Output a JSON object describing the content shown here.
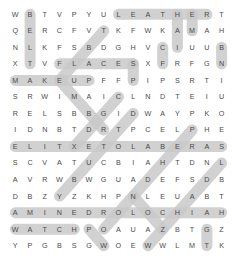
{
  "puzzle": {
    "type": "word-search",
    "rows": 15,
    "cols": 15,
    "highlight_color": "#c9c9c9",
    "letter_color": "#4a4a4a",
    "background_color": "#ffffff",
    "grid": [
      [
        "W",
        "B",
        "T",
        "V",
        "P",
        "Y",
        "U",
        "L",
        "E",
        "A",
        "T",
        "H",
        "E",
        "R",
        "T"
      ],
      [
        "Q",
        "E",
        "R",
        "C",
        "F",
        "V",
        "T",
        "K",
        "F",
        "W",
        "K",
        "A",
        "M",
        "A",
        "H"
      ],
      [
        "N",
        "L",
        "K",
        "F",
        "S",
        "B",
        "D",
        "G",
        "H",
        "V",
        "C",
        "I",
        "U",
        "U",
        "B"
      ],
      [
        "X",
        "T",
        "V",
        "F",
        "L",
        "A",
        "C",
        "E",
        "S",
        "X",
        "F",
        "R",
        "F",
        "G",
        "N"
      ],
      [
        "M",
        "A",
        "K",
        "E",
        "U",
        "P",
        "F",
        "F",
        "P",
        "I",
        "P",
        "S",
        "R",
        "T",
        "I"
      ],
      [
        "S",
        "R",
        "W",
        "I",
        "M",
        "A",
        "I",
        "C",
        "L",
        "N",
        "D",
        "T",
        "E",
        "I",
        "U"
      ],
      [
        "R",
        "E",
        "L",
        "S",
        "B",
        "B",
        "G",
        "I",
        "D",
        "W",
        "A",
        "Y",
        "P",
        "K",
        "O"
      ],
      [
        "I",
        "D",
        "N",
        "B",
        "T",
        "D",
        "R",
        "T",
        "P",
        "C",
        "E",
        "L",
        "P",
        "H",
        "E"
      ],
      [
        "E",
        "L",
        "I",
        "T",
        "X",
        "E",
        "T",
        "O",
        "L",
        "A",
        "B",
        "E",
        "R",
        "A",
        "S"
      ],
      [
        "S",
        "C",
        "V",
        "A",
        "T",
        "U",
        "C",
        "B",
        "I",
        "A",
        "H",
        "T",
        "D",
        "N",
        "L"
      ],
      [
        "A",
        "V",
        "R",
        "W",
        "B",
        "W",
        "G",
        "U",
        "A",
        "D",
        "E",
        "F",
        "S",
        "D",
        "B"
      ],
      [
        "D",
        "B",
        "Z",
        "Y",
        "Z",
        "K",
        "H",
        "P",
        "N",
        "L",
        "E",
        "U",
        "A",
        "B",
        "T"
      ],
      [
        "A",
        "M",
        "I",
        "N",
        "E",
        "D",
        "R",
        "O",
        "L",
        "O",
        "C",
        "H",
        "I",
        "A",
        "H"
      ],
      [
        "W",
        "A",
        "T",
        "C",
        "H",
        "P",
        "O",
        "A",
        "U",
        "A",
        "Z",
        "B",
        "T",
        "G",
        "Z"
      ],
      [
        "Y",
        "P",
        "G",
        "B",
        "S",
        "G",
        "W",
        "O",
        "E",
        "W",
        "W",
        "L",
        "M",
        "T",
        "K"
      ]
    ],
    "highlights": [
      {
        "word": "LEATHER",
        "start_row": 0,
        "start_col": 7,
        "end_row": 0,
        "end_col": 13,
        "direction": "horizontal"
      },
      {
        "word": "FLACES",
        "start_row": 3,
        "start_col": 3,
        "end_row": 3,
        "end_col": 8,
        "direction": "horizontal"
      },
      {
        "word": "MAKEUP",
        "start_row": 4,
        "start_col": 0,
        "end_row": 4,
        "end_col": 5,
        "direction": "horizontal"
      },
      {
        "word": "ELITXETOLABERAS",
        "start_row": 8,
        "start_col": 0,
        "end_row": 8,
        "end_col": 14,
        "direction": "horizontal"
      },
      {
        "word": "AMINEDROLOCHIA",
        "start_row": 12,
        "start_col": 0,
        "end_row": 12,
        "end_col": 14,
        "direction": "horizontal"
      },
      {
        "word": "WATCH",
        "start_row": 13,
        "start_col": 0,
        "end_row": 13,
        "end_col": 4,
        "direction": "horizontal"
      },
      {
        "word": "BELTAVRS-col1",
        "start_row": 0,
        "start_col": 1,
        "end_row": 3,
        "end_col": 1,
        "direction": "vertical"
      },
      {
        "word": "HAI-col11",
        "start_row": 0,
        "start_col": 11,
        "end_row": 2,
        "end_col": 11,
        "direction": "vertical"
      },
      {
        "word": "EM-col12",
        "start_row": 0,
        "start_col": 12,
        "end_row": 1,
        "end_col": 12,
        "direction": "vertical"
      },
      {
        "word": "BUB-col14",
        "start_row": 2,
        "start_col": 14,
        "end_row": 3,
        "end_col": 14,
        "direction": "vertical"
      },
      {
        "word": "UC-col10",
        "start_row": 2,
        "start_col": 10,
        "end_row": 3,
        "end_col": 10,
        "direction": "vertical"
      },
      {
        "word": "FRIP-col8",
        "start_row": 3,
        "start_col": 8,
        "end_row": 4,
        "end_col": 8,
        "direction": "vertical"
      },
      {
        "word": "diag-TBSAC",
        "start_row": 1,
        "start_col": 6,
        "end_row": 4,
        "end_col": 3,
        "direction": "diagonal-up-right"
      },
      {
        "word": "diag-cross-a",
        "start_row": 4,
        "start_col": 3,
        "end_row": 7,
        "end_col": 6,
        "direction": "diagonal-down-right"
      },
      {
        "word": "diag-cross-b",
        "start_row": 5,
        "start_col": 7,
        "end_row": 8,
        "end_col": 4,
        "direction": "diagonal-up-right"
      },
      {
        "word": "diag-long-1",
        "start_row": 6,
        "start_col": 8,
        "end_row": 11,
        "end_col": 3,
        "direction": "diagonal-up-right"
      },
      {
        "word": "diag-long-2",
        "start_row": 7,
        "start_col": 12,
        "end_row": 13,
        "end_col": 6,
        "direction": "diagonal-up-right"
      },
      {
        "word": "diag-long-3",
        "start_row": 9,
        "start_col": 14,
        "end_row": 14,
        "end_col": 9,
        "direction": "diagonal-up-right"
      },
      {
        "word": "diag-short-V",
        "start_row": 11,
        "start_col": 8,
        "end_row": 13,
        "end_col": 10,
        "direction": "diagonal-down-right"
      },
      {
        "word": "diag-col13",
        "start_row": 13,
        "start_col": 13,
        "end_row": 14,
        "end_col": 13,
        "direction": "vertical"
      },
      {
        "word": "diag-bottom-W",
        "start_row": 13,
        "start_col": 5,
        "end_row": 14,
        "end_col": 6,
        "direction": "diagonal-down-right"
      }
    ]
  }
}
